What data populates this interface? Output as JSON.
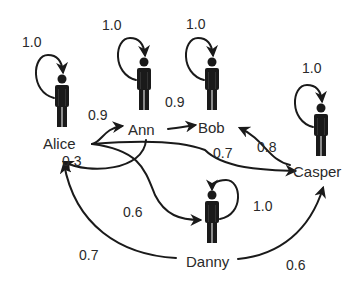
{
  "diagram": {
    "type": "weighted-directed-graph",
    "nodes": [
      {
        "id": "alice",
        "label": "Alice",
        "self_loop": "1.0"
      },
      {
        "id": "ann",
        "label": "Ann",
        "self_loop": "1.0"
      },
      {
        "id": "bob",
        "label": "Bob",
        "self_loop": "1.0"
      },
      {
        "id": "casper",
        "label": "Casper",
        "self_loop": "1.0"
      },
      {
        "id": "danny",
        "label": "Danny",
        "self_loop": "1.0"
      }
    ],
    "edges": [
      {
        "from": "Alice",
        "to": "Ann",
        "weight": "0.9"
      },
      {
        "from": "Ann",
        "to": "Bob",
        "weight": "0.9"
      },
      {
        "from": "Ann",
        "to": "Alice",
        "weight": "0.3"
      },
      {
        "from": "Alice",
        "to": "Casper",
        "weight": "0.7"
      },
      {
        "from": "Casper",
        "to": "Bob",
        "weight": "0.8"
      },
      {
        "from": "Alice",
        "to": "Danny",
        "weight": "0.6"
      },
      {
        "from": "Danny",
        "to": "Alice",
        "weight": "0.7"
      },
      {
        "from": "Danny",
        "to": "Casper",
        "weight": "0.6"
      }
    ],
    "colors": {
      "ink": "#1a1a1a",
      "text": "#2a2a2a",
      "background": "#ffffff"
    }
  }
}
